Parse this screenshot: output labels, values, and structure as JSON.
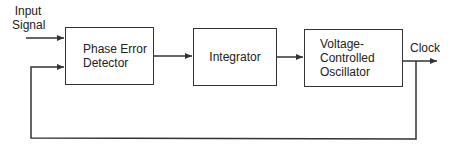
{
  "diagram": {
    "input_label": [
      "Input",
      "Signal"
    ],
    "output_label": "Clock",
    "blocks": [
      {
        "id": "phase-error-detector",
        "lines": [
          "Phase Error",
          "Detector"
        ]
      },
      {
        "id": "integrator",
        "lines": [
          "Integrator"
        ]
      },
      {
        "id": "vco",
        "lines": [
          "Voltage-",
          "Controlled",
          "Oscillator"
        ]
      }
    ],
    "connections": [
      {
        "from": "input",
        "to": "phase-error-detector"
      },
      {
        "from": "phase-error-detector",
        "to": "integrator"
      },
      {
        "from": "integrator",
        "to": "vco"
      },
      {
        "from": "vco",
        "to": "clock-output"
      },
      {
        "from": "vco",
        "to": "phase-error-detector",
        "type": "feedback"
      }
    ],
    "colors": {
      "line": "#333333",
      "text": "#222222",
      "background": "#ffffff"
    }
  }
}
